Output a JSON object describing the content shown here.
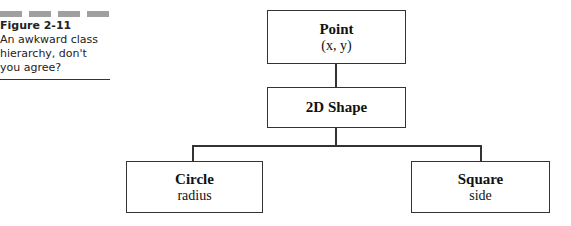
{
  "figure": {
    "number": "Figure 2-11",
    "caption": "An awkward class hierarchy, don't you agree?",
    "dash_color": "#a0a0a0"
  },
  "diagram": {
    "nodes": [
      {
        "id": "point",
        "title": "Point",
        "attribute": "(x, y)"
      },
      {
        "id": "shape2d",
        "title": "2D Shape",
        "attribute": ""
      },
      {
        "id": "circle",
        "title": "Circle",
        "attribute": "radius"
      },
      {
        "id": "square",
        "title": "Square",
        "attribute": "side"
      }
    ],
    "edges": [
      {
        "from": "point",
        "to": "shape2d"
      },
      {
        "from": "shape2d",
        "to": "circle"
      },
      {
        "from": "shape2d",
        "to": "square"
      }
    ]
  }
}
